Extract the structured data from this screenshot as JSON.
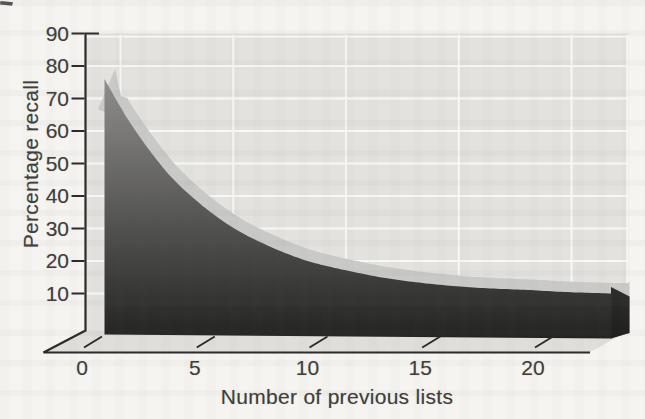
{
  "chart_data": {
    "type": "area",
    "style": "3d-grayscale-textbook-figure",
    "title": "",
    "xlabel": "Number of previous lists",
    "ylabel": "Percentage recall",
    "x_ticks": [
      0,
      5,
      10,
      15,
      20
    ],
    "y_ticks": [
      90,
      80,
      70,
      60,
      50,
      40,
      30,
      20,
      10
    ],
    "xlim": [
      0,
      24
    ],
    "ylim": [
      0,
      90
    ],
    "grid": "white horizontal and vertical gridlines on gray back wall",
    "legend": "none",
    "x": [
      1,
      2,
      3,
      4,
      5,
      6,
      7,
      8,
      9,
      10,
      11,
      12,
      13,
      14,
      15,
      16,
      17,
      18,
      19,
      20,
      21,
      22,
      23
    ],
    "series": [
      {
        "name": "Percentage recall",
        "values": [
          76,
          64,
          54,
          45.5,
          39,
          33.5,
          29,
          25.5,
          22.5,
          20,
          18.2,
          16.7,
          15.3,
          14.2,
          13.3,
          12.6,
          12,
          11.6,
          11.3,
          11,
          10.6,
          10.3,
          10.1
        ]
      }
    ]
  },
  "colors": {
    "page_bg": "#f5f4f1",
    "wall": "#e3e2df",
    "floor": "#dfdedb",
    "gridline": "#f8f8f5",
    "band_top": "#c9cac7",
    "area_top": "#949392",
    "area_bottom": "#232322",
    "side_shadow": "#000000",
    "axis": "#2b2b2b",
    "text": "#3f3e3c"
  }
}
